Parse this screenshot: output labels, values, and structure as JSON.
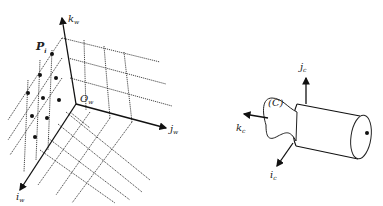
{
  "figure": {
    "world_frame": {
      "origin_label": "O",
      "origin_sub": "w",
      "axis_k_label": "k",
      "axis_k_sub": "w",
      "axis_j_label": "j",
      "axis_j_sub": "w",
      "axis_i_label": "i",
      "axis_i_sub": "w",
      "point_label": "P",
      "point_sub": "i"
    },
    "camera_frame": {
      "frame_label": "(C)",
      "axis_j_label": "j",
      "axis_j_sub": "c",
      "axis_k_label": "k",
      "axis_k_sub": "c",
      "axis_i_label": "i",
      "axis_i_sub": "c"
    },
    "colors": {
      "ink": "#111111",
      "background": "#ffffff"
    }
  }
}
